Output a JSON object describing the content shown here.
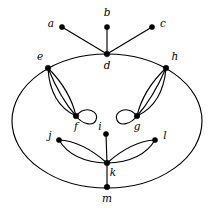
{
  "figure": {
    "background_color": "#ffffff",
    "stroke_color": "#000000",
    "width": 211,
    "height": 210
  },
  "graph": {
    "vertices": [
      {
        "id": "a",
        "label": "a",
        "x": 62,
        "y": 27,
        "label_x": 51,
        "label_y": 24,
        "dot_r": 2.6
      },
      {
        "id": "b",
        "label": "b",
        "x": 107,
        "y": 27,
        "label_x": 107,
        "label_y": 13,
        "dot_r": 2.6
      },
      {
        "id": "c",
        "label": "c",
        "x": 152,
        "y": 27,
        "label_x": 163,
        "label_y": 24,
        "dot_r": 2.6
      },
      {
        "id": "d",
        "label": "d",
        "x": 107,
        "y": 54,
        "label_x": 107,
        "label_y": 66,
        "dot_r": 2.8
      },
      {
        "id": "e",
        "label": "e",
        "x": 48,
        "y": 68,
        "label_x": 40,
        "label_y": 57,
        "dot_r": 2.8
      },
      {
        "id": "f",
        "label": "f",
        "x": 76,
        "y": 116,
        "label_x": 76,
        "label_y": 127,
        "dot_r": 2.8
      },
      {
        "id": "g",
        "label": "g",
        "x": 137,
        "y": 116,
        "label_x": 137,
        "label_y": 127,
        "dot_r": 2.8
      },
      {
        "id": "h",
        "label": "h",
        "x": 166,
        "y": 68,
        "label_x": 175,
        "label_y": 57,
        "dot_r": 2.8
      },
      {
        "id": "i",
        "label": "i",
        "x": 106,
        "y": 134,
        "label_x": 100,
        "label_y": 127,
        "dot_r": 2.6
      },
      {
        "id": "j",
        "label": "j",
        "x": 59,
        "y": 140,
        "label_x": 50,
        "label_y": 136,
        "dot_r": 2.6
      },
      {
        "id": "k",
        "label": "k",
        "x": 107,
        "y": 163,
        "label_x": 113,
        "label_y": 173,
        "dot_r": 2.8
      },
      {
        "id": "l",
        "label": "l",
        "x": 155,
        "y": 140,
        "label_x": 165,
        "label_y": 136,
        "dot_r": 2.6
      },
      {
        "id": "m",
        "label": "m",
        "x": 107,
        "y": 187,
        "label_x": 107,
        "label_y": 199,
        "dot_r": 2.8
      }
    ],
    "outer_cycle": {
      "name": "outer-ellipse",
      "center_x": 107,
      "center_y": 121,
      "radius_x": 95,
      "radius_y": 67,
      "passes_through": [
        "d",
        "e",
        "h",
        "m"
      ]
    },
    "edges": [
      {
        "id": "a-d",
        "from": "a",
        "to": "d",
        "kind": "straight",
        "multiplicity": 1
      },
      {
        "id": "b-d",
        "from": "b",
        "to": "d",
        "kind": "straight",
        "multiplicity": 1
      },
      {
        "id": "c-d",
        "from": "c",
        "to": "d",
        "kind": "straight",
        "multiplicity": 1
      },
      {
        "id": "e-f",
        "from": "e",
        "to": "f",
        "kind": "parallel-bundle",
        "multiplicity": 3
      },
      {
        "id": "h-g",
        "from": "h",
        "to": "g",
        "kind": "parallel-bundle",
        "multiplicity": 3
      },
      {
        "id": "f-loop",
        "from": "f",
        "to": "f",
        "kind": "self-loop",
        "multiplicity": 1,
        "side": "right"
      },
      {
        "id": "g-loop",
        "from": "g",
        "to": "g",
        "kind": "self-loop",
        "multiplicity": 1,
        "side": "left"
      },
      {
        "id": "j-k",
        "from": "j",
        "to": "k",
        "kind": "parallel-bundle",
        "multiplicity": 2
      },
      {
        "id": "l-k",
        "from": "l",
        "to": "k",
        "kind": "parallel-bundle",
        "multiplicity": 2
      },
      {
        "id": "i-k",
        "from": "i",
        "to": "k",
        "kind": "straight",
        "multiplicity": 1
      },
      {
        "id": "k-m",
        "from": "k",
        "to": "m",
        "kind": "straight",
        "multiplicity": 1
      }
    ],
    "edge_paths": {
      "a_d": "M 62 27 L 107 54",
      "b_d": "M 107 27 L 107 54",
      "c_d": "M 152 27 L 107 54",
      "e_f_1": "M 48 68 Q 50 104 76 116",
      "e_f_2": "M 48 68 Q 60 98 76 116",
      "e_f_3": "M 48 68 Q 70 90 76 116",
      "h_g_1": "M 166 68 Q 163 104 137 116",
      "h_g_2": "M 166 68 Q 153 98 137 116",
      "h_g_3": "M 166 68 Q 143 90 137 116",
      "f_loop": "M 76 116 C 86 104 100 112 96 120 C 93 127 82 124 76 116",
      "g_loop": "M 137 116 C 127 104 113 112 117 120 C 120 127 131 124 137 116",
      "j_k_1": "M 59 140 Q 82 141 107 163",
      "j_k_2": "M 59 140 Q 72 162 107 163",
      "l_k_1": "M 155 140 Q 132 141 107 163",
      "l_k_2": "M 155 140 Q 142 162 107 163",
      "i_k": "M 106 134 L 107 163",
      "k_m": "M 107 163 L 107 187"
    }
  }
}
